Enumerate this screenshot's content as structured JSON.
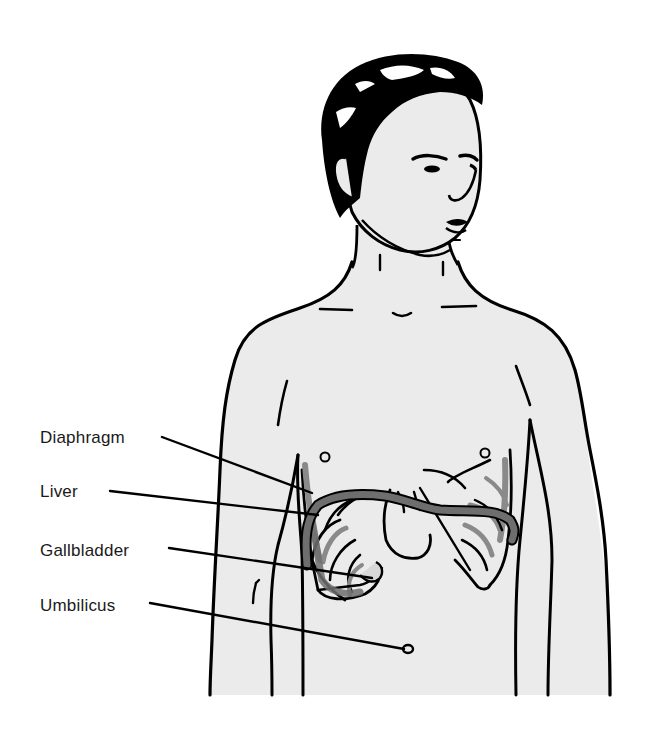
{
  "figure": {
    "colors": {
      "skin_fill": "#ebebeb",
      "outline": "#000000",
      "organ_gray": "#6e6e6e",
      "rib_gray": "#8a8a8a",
      "background": "#ffffff"
    }
  },
  "labels": [
    {
      "id": "diaphragm",
      "text": "Diaphragm",
      "x": 40,
      "y": 428
    },
    {
      "id": "liver",
      "text": "Liver",
      "x": 40,
      "y": 482
    },
    {
      "id": "gallbladder",
      "text": "Gallbladder",
      "x": 40,
      "y": 541
    },
    {
      "id": "umbilicus",
      "text": "Umbilicus",
      "x": 40,
      "y": 596
    }
  ]
}
